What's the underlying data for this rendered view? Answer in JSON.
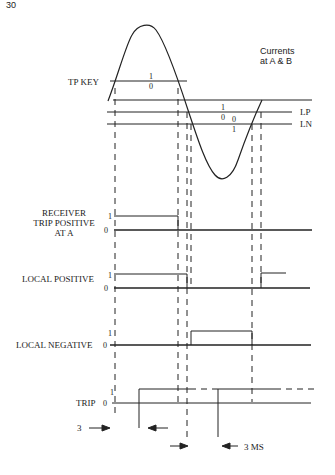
{
  "page": {
    "number": "30"
  },
  "diagram": {
    "title_annotation": [
      "Currents",
      "at A & B"
    ],
    "waveform": {
      "name": "current sine wave",
      "description": "Currents at A & B"
    },
    "thresholds": [
      {
        "id": "tp_key",
        "label": "TP KEY",
        "upper": "1",
        "lower": "0"
      },
      {
        "id": "lp",
        "label": "LP",
        "upper": "1",
        "lower": "0"
      },
      {
        "id": "ln",
        "label": "LN",
        "upper": "0",
        "lower": "1"
      }
    ],
    "signals": [
      {
        "id": "receiver_trip_positive",
        "label_lines": [
          "RECEIVER",
          "TRIP POSITIVE",
          "AT A"
        ],
        "high": "1",
        "low": "0"
      },
      {
        "id": "local_positive",
        "label_lines": [
          "LOCAL POSITIVE"
        ],
        "high": "1",
        "low": "0"
      },
      {
        "id": "local_negative",
        "label_lines": [
          "LOCAL NEGATIVE"
        ],
        "high": "1",
        "low": "0"
      },
      {
        "id": "trip",
        "label_lines": [
          "TRIP"
        ],
        "high": "1",
        "low": "0"
      }
    ],
    "timing_annotations": [
      {
        "id": "left_interval",
        "label": "3"
      },
      {
        "id": "right_interval",
        "label": "3 MS"
      }
    ]
  }
}
